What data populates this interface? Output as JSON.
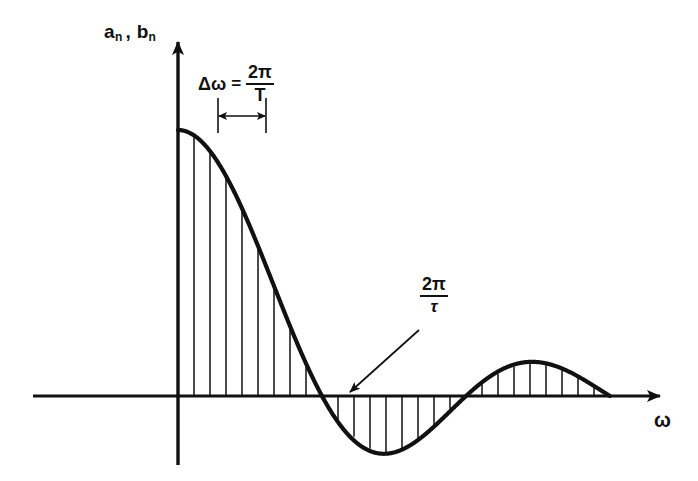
{
  "figure": {
    "background_color": "#ffffff",
    "ink_color": "#111111",
    "axes": {
      "y_label": {
        "base1": "a",
        "sub1": "n",
        "comma": ",",
        "base2": "b",
        "sub2": "n",
        "full_text": "a_n, b_n"
      },
      "x_label": "ω"
    },
    "annotations": {
      "delta_omega": {
        "lhs": "Δω",
        "equals": "=",
        "numerator": "2π",
        "denominator": "T",
        "full_text": "Δω = 2π/T"
      },
      "first_zero": {
        "numerator": "2π",
        "denominator": "τ",
        "full_text": "2π/τ"
      }
    }
  },
  "chart_data": {
    "type": "line",
    "title": "",
    "subtitle": "",
    "xlabel": "ω",
    "ylabel": "a_n, b_n",
    "grid": false,
    "legend": null,
    "envelope": {
      "function": "sinc",
      "form": "A * sin(x)/x",
      "amplitude": 1.0,
      "first_zero_x": 1.0,
      "second_zero_x": 2.0,
      "third_zero_x": 3.0,
      "negative_lobe_min": -0.217,
      "second_lobe_max": 0.128
    },
    "xlim": [
      0,
      3.2
    ],
    "ylim": [
      -0.28,
      1.08
    ],
    "stem_spacing_label": "Δω = 2π/T",
    "stems": [
      {
        "x": 0.0,
        "y": 1.0
      },
      {
        "x": 0.1111,
        "y": 0.9796
      },
      {
        "x": 0.2222,
        "y": 0.9194
      },
      {
        "x": 0.3333,
        "y": 0.827
      },
      {
        "x": 0.4444,
        "y": 0.7071
      },
      {
        "x": 0.5556,
        "y": 0.5708
      },
      {
        "x": 0.6667,
        "y": 0.4135
      },
      {
        "x": 0.7778,
        "y": 0.258
      },
      {
        "x": 0.8889,
        "y": 0.1103
      },
      {
        "x": 1.0,
        "y": 0.0
      },
      {
        "x": 1.1111,
        "y": -0.0892
      },
      {
        "x": 1.2222,
        "y": -0.1531
      },
      {
        "x": 1.3333,
        "y": -0.1985
      },
      {
        "x": 1.4444,
        "y": -0.2132
      },
      {
        "x": 1.5556,
        "y": -0.2009
      },
      {
        "x": 1.6667,
        "y": -0.1654
      },
      {
        "x": 1.7778,
        "y": -0.1129
      },
      {
        "x": 1.8889,
        "y": -0.0521
      },
      {
        "x": 2.0,
        "y": 0.0
      },
      {
        "x": 2.1111,
        "y": 0.0466
      },
      {
        "x": 2.2222,
        "y": 0.0841
      },
      {
        "x": 2.3333,
        "y": 0.1103
      },
      {
        "x": 2.4444,
        "y": 0.1242
      },
      {
        "x": 2.5556,
        "y": 0.1195
      },
      {
        "x": 2.6667,
        "y": 0.1034
      },
      {
        "x": 2.7778,
        "y": 0.0733
      },
      {
        "x": 2.8889,
        "y": 0.0346
      }
    ]
  }
}
